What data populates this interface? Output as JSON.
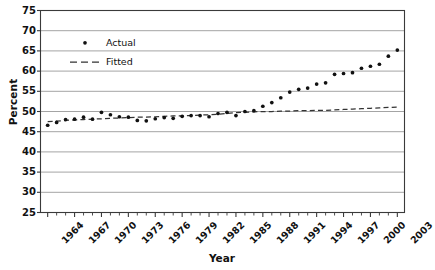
{
  "chart_data": {
    "type": "scatter",
    "title": "",
    "xlabel": "Year",
    "ylabel": "Percent",
    "xlim": [
      1963.2,
      2003.8
    ],
    "ylim": [
      25,
      75
    ],
    "yticks": [
      25,
      30,
      35,
      40,
      45,
      50,
      55,
      60,
      65,
      70,
      75
    ],
    "xticks": [
      1964,
      1967,
      1970,
      1973,
      1976,
      1979,
      1982,
      1985,
      1988,
      1991,
      1994,
      1997,
      2000,
      2003
    ],
    "xtick_labels": [
      "1964",
      "1967",
      "1970",
      "1973",
      "1976",
      "1979",
      "1982",
      "1985",
      "1988",
      "1991",
      "1994",
      "1997",
      "2000",
      "2003"
    ],
    "xtick_minor_step": 1,
    "grid": true,
    "grid_axis": "y",
    "legend_position": "upper left inside",
    "x": [
      1964,
      1965,
      1966,
      1967,
      1968,
      1969,
      1970,
      1971,
      1972,
      1973,
      1974,
      1975,
      1976,
      1977,
      1978,
      1979,
      1980,
      1981,
      1982,
      1983,
      1984,
      1985,
      1986,
      1987,
      1988,
      1989,
      1990,
      1991,
      1992,
      1993,
      1994,
      1995,
      1996,
      1997,
      1998,
      1999,
      2000,
      2001,
      2002,
      2003
    ],
    "series": [
      {
        "name": "Actual",
        "marker": "dot",
        "color": "#111111",
        "values": [
          46.6,
          47.3,
          48.0,
          48.1,
          48.6,
          48.1,
          49.8,
          49.2,
          48.7,
          48.6,
          47.8,
          47.7,
          48.2,
          48.5,
          48.3,
          48.8,
          49.0,
          49.0,
          48.7,
          49.5,
          49.8,
          49.0,
          50.0,
          50.2,
          51.3,
          52.2,
          53.4,
          54.8,
          55.5,
          55.8,
          56.8,
          57.1,
          59.2,
          59.4,
          59.6,
          60.7,
          61.2,
          61.7,
          61.3,
          61.6
        ]
      },
      {
        "name": "Fitted",
        "marker": "dashed-line",
        "color": "#333333",
        "values": [
          47.5,
          47.6,
          47.8,
          47.9,
          48.0,
          48.1,
          48.2,
          48.3,
          48.4,
          48.5,
          48.6,
          48.6,
          48.7,
          48.8,
          48.9,
          48.9,
          49.0,
          49.1,
          49.2,
          49.3,
          49.5,
          49.7,
          49.8,
          49.9,
          50.0,
          50.0,
          50.1,
          50.1,
          50.2,
          50.2,
          50.3,
          50.3,
          50.4,
          50.5,
          50.6,
          50.7,
          50.8,
          50.9,
          51.0,
          51.1
        ]
      }
    ],
    "extra_points": [
      {
        "series": "Actual",
        "x": 2002,
        "y": 63.7
      },
      {
        "series": "Actual",
        "x": 2003,
        "y": 65.2
      }
    ],
    "legend": [
      {
        "label": "Actual",
        "marker": "dot"
      },
      {
        "label": "Fitted",
        "marker": "dashed-line"
      }
    ]
  },
  "axes": {
    "ylabel": "Percent",
    "xlabel": "Year"
  }
}
